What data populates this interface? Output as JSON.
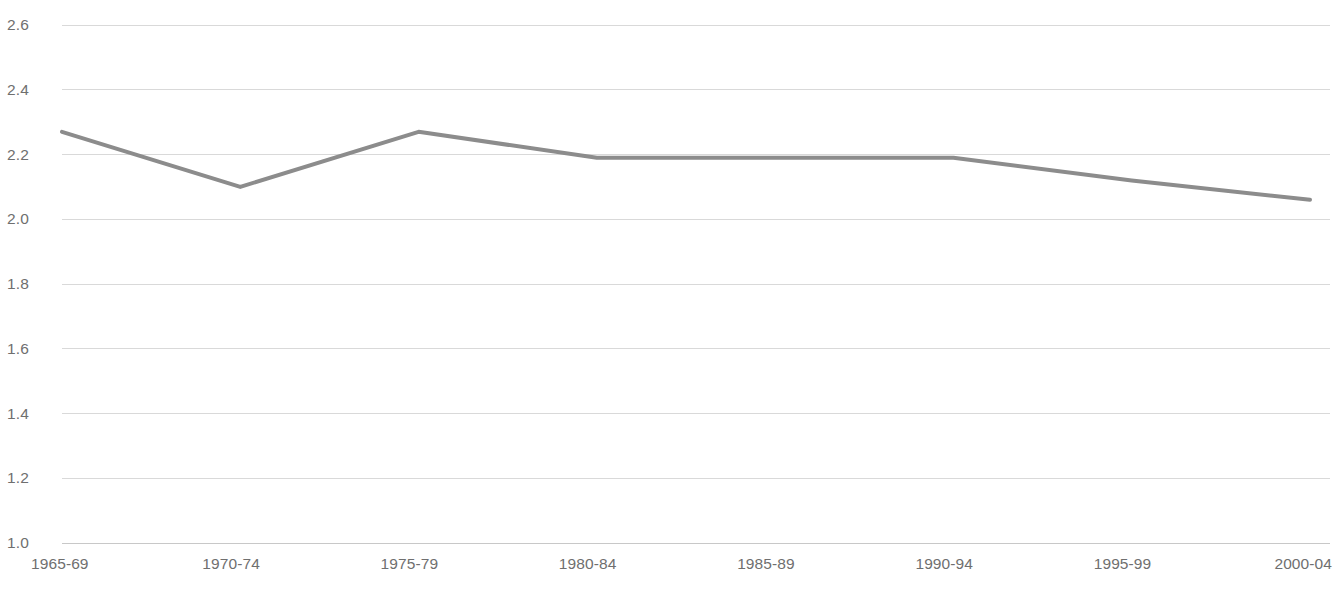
{
  "chart_data": {
    "type": "line",
    "title": "",
    "subtitle": "",
    "xlabel": "",
    "ylabel": "",
    "categories": [
      "1965-69",
      "1970-74",
      "1975-79",
      "1980-84",
      "1985-89",
      "1990-94",
      "1995-99",
      "2000-04"
    ],
    "values": [
      2.27,
      2.1,
      2.27,
      2.19,
      2.19,
      2.19,
      2.12,
      2.06
    ],
    "series": [
      {
        "name": "",
        "values": [
          2.27,
          2.1,
          2.27,
          2.19,
          2.19,
          2.19,
          2.12,
          2.06
        ],
        "color": "#8c8c8c"
      }
    ],
    "ylim": [
      1.0,
      2.6
    ],
    "yticks": [
      1.0,
      1.2,
      1.4,
      1.6,
      1.8,
      2.0,
      2.2,
      2.4,
      2.6
    ],
    "ytick_labels": [
      "1.0",
      "1.2",
      "1.4",
      "1.6",
      "1.8",
      "2.0",
      "2.2",
      "2.4",
      "2.6"
    ],
    "grid": true,
    "grid_color": "#d9d9d9",
    "legend": false,
    "legend_position": "none",
    "markers": false,
    "line_width_px": 4,
    "annotations": []
  },
  "axes": {
    "y_labels": [
      "2.6",
      "2.4",
      "2.2",
      "2.0",
      "1.8",
      "1.6",
      "1.4",
      "1.2",
      "1.0"
    ],
    "x_labels": [
      "1965-69",
      "1970-74",
      "1975-79",
      "1980-84",
      "1985-89",
      "1990-94",
      "1995-99",
      "2000-04"
    ]
  },
  "colors": {
    "line": "#8c8c8c",
    "grid": "#d9d9d9",
    "axis": "#c8c8c8",
    "tick_text": "#6f6f6f",
    "background": "#ffffff"
  },
  "footer": {
    "artifact_text": ""
  }
}
